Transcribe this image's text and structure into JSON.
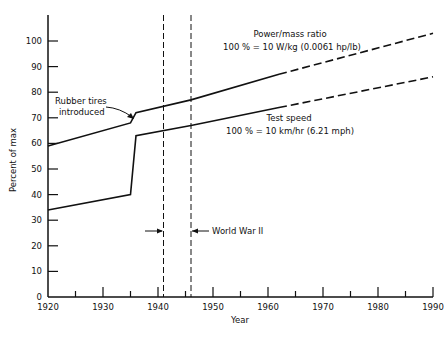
{
  "chart_data": {
    "type": "line",
    "title": "",
    "xlabel": "Year",
    "ylabel": "Percent of max",
    "xlim": [
      1920,
      1990
    ],
    "ylim": [
      0,
      110
    ],
    "x_ticks": [
      "1920",
      "1930",
      "1940",
      "1950",
      "1960",
      "1970",
      "1980",
      "1990"
    ],
    "y_ticks": [
      "0",
      "10",
      "20",
      "30",
      "40",
      "50",
      "60",
      "70",
      "80",
      "90",
      "100"
    ],
    "grid": false,
    "series": [
      {
        "name": "Power/mass ratio",
        "label_line1": "Power/mass ratio",
        "label_line2": "100 % = 10 W/kg (0.0061 hp/lb)",
        "points": [
          [
            1920,
            59
          ],
          [
            1935,
            68
          ],
          [
            1936,
            72
          ],
          [
            1946,
            77
          ],
          [
            1962,
            87
          ],
          [
            1990,
            103
          ]
        ],
        "dashed_from": 1962
      },
      {
        "name": "Test speed",
        "label_line1": "Test speed",
        "label_line2": "100 % = 10 km/hr (6.21 mph)",
        "points": [
          [
            1920,
            34
          ],
          [
            1935,
            40
          ],
          [
            1936,
            63
          ],
          [
            1946,
            67
          ],
          [
            1962,
            74
          ],
          [
            1990,
            86
          ]
        ],
        "dashed_from": 1962
      }
    ],
    "annotations": [
      {
        "text_line1": "Rubber tires",
        "text_line2": "introduced",
        "x": 1935.5
      },
      {
        "text": "World War II",
        "x_start": 1941,
        "x_end": 1946
      }
    ]
  },
  "labels": {
    "power_l1": "Power/mass ratio",
    "power_l2": "100 % = 10 W/kg (0.0061 hp/lb)",
    "speed_l1": "Test speed",
    "speed_l2": "100 % = 10 km/hr (6.21 mph)",
    "rubber_l1": "Rubber tires",
    "rubber_l2": "introduced",
    "ww2": "World War II",
    "xlabel": "Year",
    "ylabel": "Percent of max"
  }
}
